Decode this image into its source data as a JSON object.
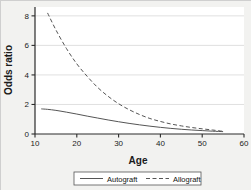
{
  "chart_data": {
    "type": "line",
    "title": "",
    "xlabel": "Age",
    "ylabel": "Odds ratio",
    "xlim": [
      10,
      60
    ],
    "ylim": [
      0,
      8.6
    ],
    "xticks": [
      10,
      20,
      30,
      40,
      50,
      60
    ],
    "yticks": [
      0,
      2,
      4,
      6,
      8
    ],
    "xtick_labels": [
      "10",
      "20",
      "30",
      "40",
      "50",
      "60"
    ],
    "ytick_labels": [
      "0",
      "2",
      "4",
      "6",
      "8"
    ],
    "grid": "horizontal",
    "legend_position": "bottom-outside",
    "background": "#f2f2f0",
    "plot_background": "#ffffff",
    "series": [
      {
        "name": "Autograft",
        "style": "solid",
        "color": "#555555",
        "x": [
          11.5,
          13,
          15,
          17.5,
          20,
          22.5,
          25,
          27.5,
          30,
          32.5,
          35,
          37.5,
          40,
          42.5,
          45,
          47.5,
          50,
          52.5,
          55
        ],
        "y": [
          1.7,
          1.67,
          1.6,
          1.48,
          1.35,
          1.21,
          1.08,
          0.95,
          0.83,
          0.72,
          0.62,
          0.53,
          0.45,
          0.38,
          0.32,
          0.27,
          0.23,
          0.19,
          0.16
        ]
      },
      {
        "name": "Allograft",
        "style": "dashed",
        "color": "#555555",
        "x": [
          13,
          15,
          17.5,
          20,
          22.5,
          25,
          27.5,
          30,
          32.5,
          35,
          37.5,
          40,
          42.5,
          45,
          47.5,
          50,
          52.5,
          55
        ],
        "y": [
          8.2,
          7.05,
          5.8,
          4.75,
          3.9,
          3.15,
          2.55,
          2.05,
          1.65,
          1.32,
          1.05,
          0.85,
          0.68,
          0.55,
          0.44,
          0.35,
          0.27,
          0.18
        ]
      }
    ]
  },
  "legend": {
    "entries": [
      {
        "label": "Autograft",
        "style": "solid"
      },
      {
        "label": "Allograft",
        "style": "dashed"
      }
    ]
  }
}
